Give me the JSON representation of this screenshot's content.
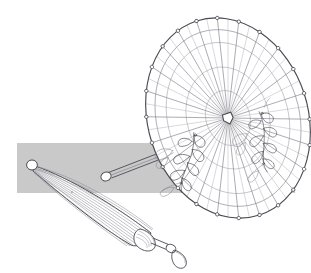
{
  "illustration": {
    "title": "Parasol line drawing",
    "subject": "two parasols, one open and one furled",
    "background_color": "#ffffff",
    "ink_color": "#4a4a52",
    "band": {
      "name": "gray-horizontal-band",
      "color": "#c9c9c9",
      "x": 17,
      "y": 143,
      "width": 278,
      "height": 50
    },
    "open_parasol": {
      "label": "open parasol",
      "canopy": {
        "center_x": 228,
        "center_y": 118,
        "radius_x": 80,
        "radius_y": 102,
        "rotation_deg": -18,
        "rib_count": 24,
        "ring_count": 4,
        "rib_tip_dot_radius": 1.6
      },
      "hub": {
        "label": "center hub",
        "x": 228,
        "y": 118,
        "radius": 4.5
      },
      "shaft": {
        "label": "handle shaft",
        "x1": 222,
        "y1": 130,
        "x2": 103,
        "y2": 175,
        "knob_radius": 4.5
      },
      "motifs": [
        {
          "name": "floral-motif-left",
          "x": 188,
          "y": 160,
          "scale": 1.0,
          "rotation_deg": 12
        },
        {
          "name": "floral-motif-right",
          "x": 262,
          "y": 140,
          "scale": 0.95,
          "rotation_deg": -6
        }
      ]
    },
    "closed_parasol": {
      "label": "furled parasol",
      "finial": {
        "label": "tip finial",
        "x": 32,
        "y": 164,
        "radius": 5
      },
      "body": {
        "label": "furled canopy body",
        "tip_x": 34,
        "tip_y": 167,
        "base_x": 150,
        "base_y": 238,
        "max_width": 30,
        "rib_lines": 13
      },
      "collar": {
        "label": "collar ferrule",
        "x": 148,
        "y": 236,
        "width": 14,
        "height": 13
      },
      "handle": {
        "label": "handle with strap loop",
        "x1": 152,
        "y1": 240,
        "x2": 172,
        "y2": 249,
        "loop_cx": 180,
        "loop_cy": 256,
        "loop_rx": 7,
        "loop_ry": 10
      }
    }
  }
}
